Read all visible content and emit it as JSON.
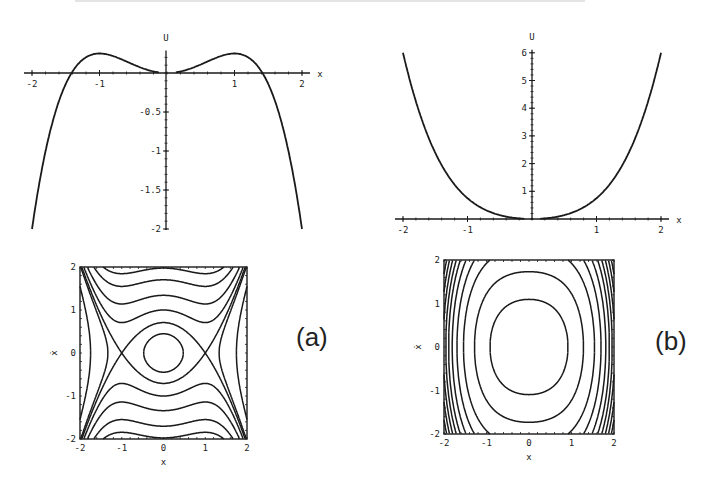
{
  "panel_labels": {
    "a": "(a)",
    "b": "(b)"
  },
  "colors": {
    "line": "#1a1a1a",
    "background": "#ffffff"
  },
  "chart_data": [
    {
      "id": "potential-a",
      "type": "line",
      "title": "",
      "xlabel": "x",
      "ylabel": "U",
      "function": "U = x^2/2 - x^4/4",
      "xlim": [
        -2,
        2
      ],
      "ylim": [
        -2,
        0.25
      ],
      "xticks": [
        "-2",
        "-1",
        "1",
        "2"
      ],
      "yticks": [
        "-0.5",
        "-1",
        "-1.5",
        "-2"
      ],
      "x": [
        -2,
        -1.5,
        -1.41,
        -1,
        -0.5,
        0,
        0.5,
        1,
        1.41,
        1.5,
        2
      ],
      "values": [
        -2,
        -0.14,
        0,
        0.25,
        0.11,
        0,
        0.11,
        0.25,
        0,
        -0.14,
        -2
      ],
      "grid": false
    },
    {
      "id": "potential-b",
      "type": "line",
      "title": "",
      "xlabel": "x",
      "ylabel": "U",
      "function": "U = x^2/2 + x^4/4",
      "xlim": [
        -2,
        2
      ],
      "ylim": [
        0,
        6
      ],
      "xticks": [
        "-2",
        "-1",
        "1",
        "2"
      ],
      "yticks": [
        "1",
        "2",
        "3",
        "4",
        "5",
        "6"
      ],
      "x": [
        -2,
        -1.5,
        -1,
        -0.5,
        0,
        0.5,
        1,
        1.5,
        2
      ],
      "values": [
        6,
        2.39,
        0.75,
        0.14,
        0,
        0.14,
        0.75,
        2.39,
        6
      ],
      "grid": false
    },
    {
      "id": "phase-portrait-a",
      "type": "line",
      "title": "",
      "xlabel": "x",
      "ylabel": "ẋ",
      "description": "contours of E = ẋ^2/2 + x^2/2 - x^4/4",
      "xlim": [
        -2,
        2
      ],
      "ylim": [
        -2,
        2
      ],
      "xticks": [
        "-2",
        "-1",
        "0",
        "1",
        "2"
      ],
      "yticks": [
        "2",
        "1",
        "0",
        "-1",
        "-2"
      ],
      "energy_levels": [
        -2.2,
        -0.8,
        0.1,
        0.25,
        0.5,
        0.9,
        1.45,
        1.95
      ],
      "grid": false
    },
    {
      "id": "phase-portrait-b",
      "type": "line",
      "title": "",
      "xlabel": "x",
      "ylabel": "ẋ",
      "description": "contours of E = ẋ^2/2 + x^2/2 + x^4/4",
      "xlim": [
        -2,
        2
      ],
      "ylim": [
        -2,
        2
      ],
      "xticks": [
        "-2",
        "-1",
        "0",
        "1",
        "2"
      ],
      "yticks": [
        "2",
        "1",
        "0",
        "-1",
        "-2"
      ],
      "energy_levels": [
        0.6,
        1.5,
        2.6,
        3.5,
        4.3,
        5.0,
        5.6,
        6.2,
        6.8,
        7.4,
        8.0,
        8.6
      ],
      "grid": false
    }
  ]
}
